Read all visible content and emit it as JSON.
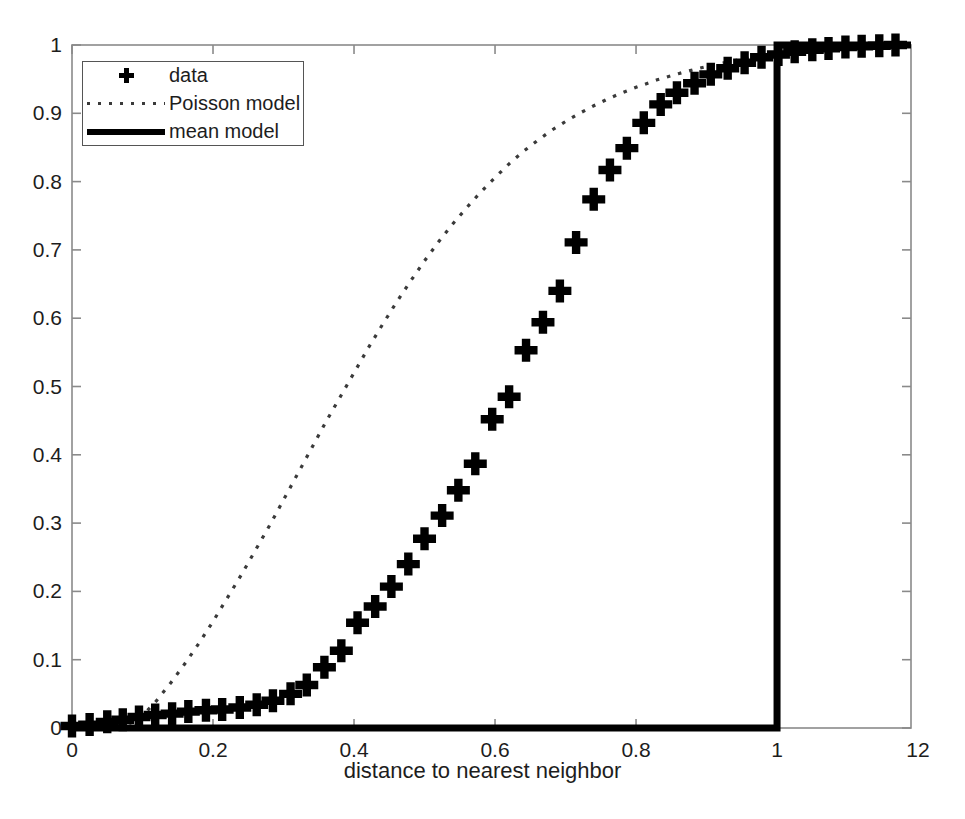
{
  "figure": {
    "background_color": "#ffffff",
    "axis_color": "#808080",
    "data_color": "#000000"
  },
  "axes": {
    "x_title": "distance to nearest neighbor",
    "y_title": "",
    "x_ticks": [
      "0",
      "0.2",
      "0.4",
      "0.6",
      "0.8",
      "1",
      "12"
    ],
    "x_tick_values": [
      0,
      0.2,
      0.4,
      0.6,
      0.8,
      1.0,
      1.2
    ],
    "y_ticks": [
      "0",
      "0.1",
      "0.2",
      "0.3",
      "0.4",
      "0.5",
      "0.6",
      "0.7",
      "0.8",
      "0.9",
      "1"
    ],
    "y_tick_values": [
      0,
      0.1,
      0.2,
      0.3,
      0.4,
      0.5,
      0.6,
      0.7,
      0.8,
      0.9,
      1.0
    ]
  },
  "legend": {
    "position": "top-left",
    "entries": [
      {
        "label": "data",
        "marker": "plus-marker",
        "style": "marker"
      },
      {
        "label": "Poisson model",
        "marker": "dotted-line",
        "style": "dotted"
      },
      {
        "label": "mean model",
        "marker": "solid-line",
        "style": "solid"
      }
    ]
  },
  "chart_data": {
    "type": "line",
    "title": "",
    "xlabel": "distance to nearest neighbor",
    "ylabel": "",
    "xlim": [
      0,
      1.19
    ],
    "ylim": [
      0,
      1.0
    ],
    "grid": false,
    "legend_position": "top-left",
    "series": [
      {
        "name": "data",
        "style": "scatter",
        "marker": "plus",
        "x": [
          0.0,
          0.025,
          0.05,
          0.072,
          0.095,
          0.118,
          0.142,
          0.165,
          0.19,
          0.213,
          0.238,
          0.262,
          0.285,
          0.31,
          0.333,
          0.358,
          0.382,
          0.405,
          0.43,
          0.453,
          0.477,
          0.5,
          0.525,
          0.548,
          0.572,
          0.596,
          0.62,
          0.644,
          0.668,
          0.692,
          0.715,
          0.74,
          0.763,
          0.787,
          0.811,
          0.835,
          0.858,
          0.883,
          0.906,
          0.93,
          0.954,
          0.978,
          1.002,
          1.025,
          1.05,
          1.073,
          1.097,
          1.12,
          1.145,
          1.168
        ],
        "y": [
          0.003,
          0.005,
          0.009,
          0.012,
          0.016,
          0.019,
          0.021,
          0.024,
          0.026,
          0.027,
          0.03,
          0.034,
          0.04,
          0.05,
          0.063,
          0.089,
          0.113,
          0.154,
          0.178,
          0.207,
          0.24,
          0.277,
          0.311,
          0.348,
          0.387,
          0.452,
          0.485,
          0.553,
          0.594,
          0.64,
          0.711,
          0.774,
          0.817,
          0.849,
          0.886,
          0.913,
          0.93,
          0.944,
          0.957,
          0.966,
          0.974,
          0.982,
          0.986,
          0.99,
          0.993,
          0.995,
          0.997,
          0.998,
          0.999,
          1.0
        ]
      },
      {
        "name": "Poisson model",
        "style": "dotted",
        "x": [
          0.0,
          0.02,
          0.04,
          0.06,
          0.08,
          0.09,
          0.1,
          0.12,
          0.14,
          0.16,
          0.18,
          0.2,
          0.22,
          0.24,
          0.26,
          0.28,
          0.3,
          0.32,
          0.34,
          0.36,
          0.38,
          0.4,
          0.42,
          0.44,
          0.46,
          0.48,
          0.5,
          0.52,
          0.54,
          0.56,
          0.58,
          0.6,
          0.62,
          0.64,
          0.66,
          0.68,
          0.7,
          0.72,
          0.74,
          0.76,
          0.78,
          0.8,
          0.83,
          0.86,
          0.89,
          0.92,
          0.95,
          0.98,
          1.01,
          1.05,
          1.1,
          1.15,
          1.19
        ],
        "y": [
          0.0,
          0.0,
          0.0,
          0.002,
          0.006,
          0.01,
          0.018,
          0.04,
          0.066,
          0.094,
          0.124,
          0.156,
          0.19,
          0.224,
          0.26,
          0.296,
          0.334,
          0.372,
          0.41,
          0.448,
          0.484,
          0.52,
          0.556,
          0.59,
          0.623,
          0.654,
          0.684,
          0.712,
          0.738,
          0.762,
          0.785,
          0.806,
          0.826,
          0.844,
          0.86,
          0.875,
          0.888,
          0.9,
          0.911,
          0.921,
          0.93,
          0.938,
          0.949,
          0.958,
          0.966,
          0.973,
          0.979,
          0.984,
          0.988,
          0.993,
          0.997,
          0.999,
          1.0
        ]
      },
      {
        "name": "mean model",
        "style": "solid-step",
        "x": [
          0.0,
          1.0,
          1.0,
          1.19
        ],
        "y": [
          0.0,
          0.0,
          1.0,
          1.0
        ]
      }
    ]
  }
}
